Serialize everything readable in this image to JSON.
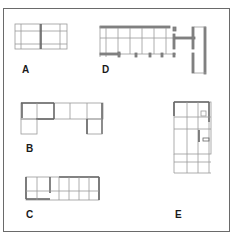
{
  "figure": {
    "colors": {
      "frame": "#6a6a6a",
      "wall": "#7a7a7a",
      "grid": "#9a9a9a",
      "label": "#1a1a1a",
      "background": "#ffffff"
    },
    "plans": [
      {
        "id": "A",
        "label": "A"
      },
      {
        "id": "B",
        "label": "B"
      },
      {
        "id": "C",
        "label": "C"
      },
      {
        "id": "D",
        "label": "D"
      },
      {
        "id": "E",
        "label": "E"
      }
    ]
  }
}
